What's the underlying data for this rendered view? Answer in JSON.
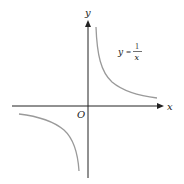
{
  "diagram": {
    "axes": {
      "x_label": "x",
      "y_label": "y",
      "origin_label": "O"
    },
    "equation": {
      "lhs": "y",
      "equals": "=",
      "numerator": "1",
      "denominator": "x"
    },
    "colors": {
      "axis": "#222222",
      "curve": "#9a9a9a",
      "background": "#ffffff"
    }
  }
}
